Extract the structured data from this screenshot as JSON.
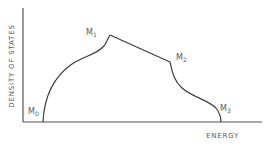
{
  "diagram": {
    "title": "",
    "x_axis_label": "ENERGY",
    "y_axis_label": "DENSITY OF STATES",
    "line_color": "#3c3c3c",
    "axis_color": "#555555",
    "critical_points": [
      {
        "id": "M0",
        "base": "M",
        "sub": "0"
      },
      {
        "id": "M1",
        "base": "M",
        "sub": "1"
      },
      {
        "id": "M2",
        "base": "M",
        "sub": "2"
      },
      {
        "id": "M3",
        "base": "M",
        "sub": "3"
      }
    ]
  }
}
